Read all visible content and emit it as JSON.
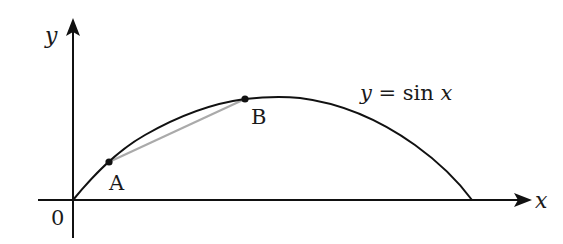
{
  "diagram": {
    "axes": {
      "x_label": "x",
      "y_label": "y",
      "origin_label": "0"
    },
    "curve": {
      "equation_label_y": "y",
      "equation_label_eq": " = sin ",
      "equation_label_x": "x",
      "function": "sin x",
      "domain": "0 to π"
    },
    "points": [
      {
        "label": "A",
        "description": "point on curve near origin"
      },
      {
        "label": "B",
        "description": "point on curve near maximum"
      }
    ],
    "chord": {
      "from": "A",
      "to": "B",
      "color": "#aaaaaa"
    },
    "colors": {
      "axis": "#111111",
      "curve": "#111111",
      "chord": "#aaaaaa",
      "background": "#ffffff"
    }
  }
}
